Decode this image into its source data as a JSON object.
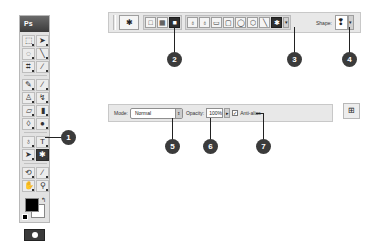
{
  "toolbox": {
    "header": "Ps",
    "tools": [
      {
        "name": "marquee",
        "glyph": "⬚"
      },
      {
        "name": "move",
        "glyph": "➤"
      },
      {
        "name": "lasso",
        "glyph": "◌"
      },
      {
        "name": "magic-wand",
        "glyph": "╲"
      },
      {
        "name": "crop",
        "glyph": "⌗"
      },
      {
        "name": "eyedropper",
        "glyph": "∕"
      },
      {
        "name": "healing-brush",
        "glyph": "✎"
      },
      {
        "name": "brush",
        "glyph": "∕"
      },
      {
        "name": "clone-stamp",
        "glyph": "♙"
      },
      {
        "name": "history-brush",
        "glyph": "↯"
      },
      {
        "name": "eraser",
        "glyph": "▱"
      },
      {
        "name": "gradient",
        "glyph": "▮"
      },
      {
        "name": "blur",
        "glyph": "◊"
      },
      {
        "name": "dodge",
        "glyph": "●"
      },
      {
        "name": "pen",
        "glyph": "♁"
      },
      {
        "name": "type",
        "glyph": "T"
      },
      {
        "name": "path-selection",
        "glyph": "➤"
      },
      {
        "name": "custom-shape",
        "glyph": "✱",
        "active": true
      },
      {
        "name": "3d-rotate",
        "glyph": "⟲"
      },
      {
        "name": "3d-camera",
        "glyph": "∕"
      },
      {
        "name": "hand",
        "glyph": "✋"
      },
      {
        "name": "zoom",
        "glyph": "⚲"
      }
    ],
    "swap_glyph": "↰"
  },
  "options_bar_top": {
    "preset_glyph": "✱",
    "mode_buttons": [
      "□",
      "▦",
      "■"
    ],
    "draw_tools": [
      "♁",
      "♁",
      "▭",
      "▢",
      "◯",
      "⬡",
      "╲",
      "✱"
    ],
    "shape_label": "Shape:",
    "shape_glyph": "❢",
    "arrow": "▾"
  },
  "options_bar_bottom": {
    "mode_label": "Mode:",
    "mode_value": "Normal",
    "opacity_label": "Opacity:",
    "opacity_value": "100%",
    "anti_alias_label": "Anti-alias",
    "anti_alias_checked": "✓",
    "spin": "⇕",
    "arrow": "▸",
    "palette_glyph": "⊞"
  },
  "callouts": [
    "1",
    "2",
    "3",
    "4",
    "5",
    "6",
    "7"
  ]
}
